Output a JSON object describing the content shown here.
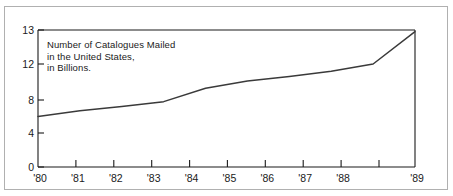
{
  "chart_data": {
    "type": "line",
    "title": "",
    "annotation": {
      "lines": [
        "Number of Catalogues Mailed",
        "in the United States,",
        "in Billions."
      ]
    },
    "xlabel": "",
    "ylabel": "",
    "categories": [
      "'80",
      "'81",
      "'82",
      "'83",
      "'84",
      "'85",
      "'86",
      "'87",
      "'88",
      "'89"
    ],
    "values": [
      6.0,
      6.7,
      7.2,
      7.8,
      9.3,
      10.1,
      10.6,
      11.2,
      12.0,
      12.95
    ],
    "series": [
      {
        "name": "Number of Catalogues Mailed in the United States, in Billions.",
        "values": [
          6.0,
          6.7,
          7.2,
          7.8,
          9.3,
          10.1,
          10.6,
          11.2,
          12.0,
          12.95
        ]
      }
    ],
    "ytick_labels": [
      "0",
      "4",
      "8",
      "12",
      "13"
    ],
    "ytick_values": [
      0,
      4,
      8,
      12,
      13
    ],
    "ylim": [
      0,
      13
    ],
    "xlim": [
      "'80",
      "'89"
    ],
    "grid": false,
    "legend": "none",
    "line_color": "#3a3a3a",
    "axis_color": "#1a1a1a",
    "frame_color": "#b0b0b0",
    "background_color": "#ffffff"
  },
  "axis": {
    "y_ticks": [
      {
        "label": "0",
        "value": 0
      },
      {
        "label": "4",
        "value": 4
      },
      {
        "label": "8",
        "value": 8
      },
      {
        "label": "12",
        "value": 12
      },
      {
        "label": "13",
        "value": 13
      }
    ],
    "x_ticks": [
      {
        "label": "'80"
      },
      {
        "label": "'81"
      },
      {
        "label": "'82"
      },
      {
        "label": "'83"
      },
      {
        "label": "'84"
      },
      {
        "label": "'85"
      },
      {
        "label": "'86"
      },
      {
        "label": "'87"
      },
      {
        "label": "'88"
      },
      {
        "label": "'89"
      }
    ]
  }
}
